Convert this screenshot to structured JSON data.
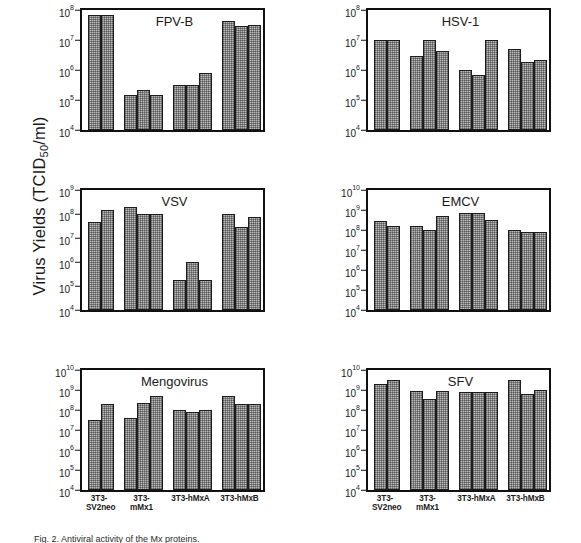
{
  "figure": {
    "ylabel_main": "Virus Yields (TCID",
    "ylabel_sub": "50",
    "ylabel_tail": "/ml)",
    "ylabel_full": "Virus Yields (TCID50/ml)",
    "caption": "Fig. 2. Antiviral activity of the Mx proteins."
  },
  "axis": {
    "categories": [
      "3T3-SV2neo",
      "3T3-mMx1",
      "3T3-hMxA",
      "3T3-hMxB"
    ],
    "bars_per_group": [
      2,
      3,
      3,
      3
    ],
    "bar_fill_color": "#b9b9b9",
    "bar_edge_color": "#1d1d1d"
  },
  "chart_data": [
    {
      "type": "bar",
      "title": "FPV-B",
      "xlabel": "",
      "ylabel": "Virus Yields (TCID50/ml)",
      "log_scale": true,
      "ylim": [
        10000,
        100000000
      ],
      "tick_labels": [
        "10",
        "10",
        "10",
        "10",
        "10"
      ],
      "tick_exponents": [
        "4",
        "5",
        "6",
        "7",
        "8"
      ],
      "tick_values": [
        10000,
        100000,
        1000000,
        10000000,
        100000000
      ],
      "categories": [
        "3T3-SV2neo",
        "3T3-mMx1",
        "3T3-hMxA",
        "3T3-hMxB"
      ],
      "groups": [
        {
          "category": "3T3-SV2neo",
          "values": [
            70000000,
            70000000
          ]
        },
        {
          "category": "3T3-mMx1",
          "values": [
            150000,
            220000,
            150000
          ]
        },
        {
          "category": "3T3-hMxA",
          "values": [
            310000,
            310000,
            800000
          ]
        },
        {
          "category": "3T3-hMxB",
          "values": [
            42000000,
            30000000,
            31000000
          ]
        }
      ]
    },
    {
      "type": "bar",
      "title": "HSV-1",
      "xlabel": "",
      "ylabel": "Virus Yields (TCID50/ml)",
      "log_scale": true,
      "ylim": [
        10000,
        100000000
      ],
      "tick_labels": [
        "10",
        "10",
        "10",
        "10",
        "10"
      ],
      "tick_exponents": [
        "4",
        "5",
        "6",
        "7",
        "8"
      ],
      "tick_values": [
        10000,
        100000,
        1000000,
        10000000,
        100000000
      ],
      "categories": [
        "3T3-SV2neo",
        "3T3-mMx1",
        "3T3-hMxA",
        "3T3-hMxB"
      ],
      "groups": [
        {
          "category": "3T3-SV2neo",
          "values": [
            10000000,
            10000000
          ]
        },
        {
          "category": "3T3-mMx1",
          "values": [
            3000000,
            10000000,
            4200000
          ]
        },
        {
          "category": "3T3-hMxA",
          "values": [
            1000000,
            700000,
            10000000
          ]
        },
        {
          "category": "3T3-hMxB",
          "values": [
            5000000,
            1800000,
            2100000
          ]
        }
      ]
    },
    {
      "type": "bar",
      "title": "VSV",
      "xlabel": "",
      "ylabel": "Virus Yields (TCID50/ml)",
      "log_scale": true,
      "ylim": [
        10000,
        1000000000
      ],
      "tick_labels": [
        "10",
        "10",
        "10",
        "10",
        "10",
        "10"
      ],
      "tick_exponents": [
        "4",
        "5",
        "6",
        "7",
        "8",
        "9"
      ],
      "tick_values": [
        10000,
        100000,
        1000000,
        10000000,
        100000000,
        1000000000
      ],
      "categories": [
        "3T3-SV2neo",
        "3T3-mMx1",
        "3T3-hMxA",
        "3T3-hMxB"
      ],
      "groups": [
        {
          "category": "3T3-SV2neo",
          "values": [
            45000000,
            150000000
          ]
        },
        {
          "category": "3T3-mMx1",
          "values": [
            200000000,
            100000000,
            105000000
          ]
        },
        {
          "category": "3T3-hMxA",
          "values": [
            180000,
            1000000,
            180000
          ]
        },
        {
          "category": "3T3-hMxB",
          "values": [
            100000000,
            30000000,
            75000000
          ]
        }
      ]
    },
    {
      "type": "bar",
      "title": "EMCV",
      "xlabel": "",
      "ylabel": "Virus Yields (TCID50/ml)",
      "log_scale": true,
      "ylim": [
        10000,
        10000000000
      ],
      "tick_labels": [
        "10",
        "10",
        "10",
        "10",
        "10",
        "10",
        "10"
      ],
      "tick_exponents": [
        "4",
        "5",
        "6",
        "7",
        "8",
        "9",
        "10"
      ],
      "tick_values": [
        10000,
        100000,
        1000000,
        10000000,
        100000000,
        1000000000,
        10000000000
      ],
      "categories": [
        "3T3-SV2neo",
        "3T3-mMx1",
        "3T3-hMxA",
        "3T3-hMxB"
      ],
      "groups": [
        {
          "category": "3T3-SV2neo",
          "values": [
            290000000,
            150000000
          ]
        },
        {
          "category": "3T3-mMx1",
          "values": [
            150000000,
            100000000,
            500000000
          ]
        },
        {
          "category": "3T3-hMxA",
          "values": [
            750000000,
            750000000,
            300000000
          ]
        },
        {
          "category": "3T3-hMxB",
          "values": [
            100000000,
            80000000,
            78000000
          ]
        }
      ]
    },
    {
      "type": "bar",
      "title": "Mengovirus",
      "xlabel": "",
      "ylabel": "Virus Yields (TCID50/ml)",
      "log_scale": true,
      "ylim": [
        10000,
        10000000000
      ],
      "tick_labels": [
        "10",
        "10",
        "10",
        "10",
        "10",
        "10",
        "10"
      ],
      "tick_exponents": [
        "4",
        "5",
        "6",
        "7",
        "8",
        "9",
        "10"
      ],
      "tick_values": [
        10000,
        100000,
        1000000,
        10000000,
        100000000,
        1000000000,
        10000000000
      ],
      "categories": [
        "3T3-SV2neo",
        "3T3-mMx1",
        "3T3-hMxA",
        "3T3-hMxB"
      ],
      "groups": [
        {
          "category": "3T3-SV2neo",
          "values": [
            30000000,
            200000000
          ]
        },
        {
          "category": "3T3-mMx1",
          "values": [
            40000000,
            220000000,
            500000000
          ]
        },
        {
          "category": "3T3-hMxA",
          "values": [
            100000000,
            80000000,
            100000000
          ]
        },
        {
          "category": "3T3-hMxB",
          "values": [
            500000000,
            210000000,
            210000000
          ]
        }
      ]
    },
    {
      "type": "bar",
      "title": "SFV",
      "xlabel": "",
      "ylabel": "Virus Yields (TCID50/ml)",
      "log_scale": true,
      "ylim": [
        10000,
        10000000000
      ],
      "tick_labels": [
        "10",
        "10",
        "10",
        "10",
        "10",
        "10",
        "10"
      ],
      "tick_exponents": [
        "4",
        "5",
        "6",
        "7",
        "8",
        "9",
        "10"
      ],
      "tick_values": [
        10000,
        100000,
        1000000,
        10000000,
        100000000,
        1000000000,
        10000000000
      ],
      "categories": [
        "3T3-SV2neo",
        "3T3-mMx1",
        "3T3-hMxA",
        "3T3-hMxB"
      ],
      "groups": [
        {
          "category": "3T3-SV2neo",
          "values": [
            2000000000,
            3000000000
          ]
        },
        {
          "category": "3T3-mMx1",
          "values": [
            850000000,
            350000000,
            850000000
          ]
        },
        {
          "category": "3T3-hMxA",
          "values": [
            830000000,
            830000000,
            830000000
          ]
        },
        {
          "category": "3T3-hMxB",
          "values": [
            3000000000,
            600000000,
            1000000000
          ]
        }
      ]
    }
  ]
}
